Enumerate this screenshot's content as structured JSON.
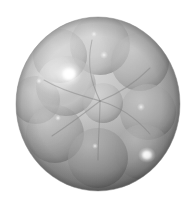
{
  "image": {
    "title": "Translucent sphere cluster render",
    "width": 194,
    "height": 203,
    "background_color": "#ffffff",
    "color_mode": "grayscale",
    "subject": "large translucent outer sphere enclosing a packed cluster of smaller translucent spheres"
  },
  "palette": {
    "background": "#ffffff",
    "outer_sphere_light": "#d8d8d8",
    "outer_sphere_mid": "#b4b4b4",
    "outer_sphere_dark": "#8e8e8e",
    "outer_sphere_rim": "#7b7b7b",
    "inner_sphere_light": "#cfcfcf",
    "inner_sphere_mid": "#a9a9a9",
    "inner_sphere_dark": "#8a8a8a",
    "lobe_edge": "#7f7f7f",
    "specular_white": "#ffffff",
    "shadow_bottom": "#7a7a7a"
  },
  "outer_sphere": {
    "label": "outer-sphere",
    "center_x": 98,
    "center_y": 104,
    "radius_x": 82,
    "radius_y": 87,
    "light_direction": "upper-left",
    "bounds": {
      "left": 16,
      "top": 17,
      "right": 180,
      "bottom": 191
    }
  },
  "inner_spheres": [
    {
      "id": "lobe-top-center",
      "cx": 100,
      "cy": 45,
      "r": 30,
      "shade": "#b9b9b9"
    },
    {
      "id": "lobe-upper-left",
      "cx": 60,
      "cy": 56,
      "r": 27,
      "shade": "#bdbdbd"
    },
    {
      "id": "lobe-upper-right",
      "cx": 140,
      "cy": 62,
      "r": 29,
      "shade": "#ababab"
    },
    {
      "id": "lobe-left-bright",
      "cx": 66,
      "cy": 86,
      "r": 30,
      "shade": "#c8c8c8"
    },
    {
      "id": "lobe-far-left",
      "cx": 36,
      "cy": 100,
      "r": 24,
      "shade": "#b0b0b0"
    },
    {
      "id": "lobe-right-mid",
      "cx": 148,
      "cy": 112,
      "r": 28,
      "shade": "#a4a4a4"
    },
    {
      "id": "lobe-lower-left",
      "cx": 55,
      "cy": 134,
      "r": 29,
      "shade": "#a8a8a8"
    },
    {
      "id": "lobe-bottom-center",
      "cx": 98,
      "cy": 158,
      "r": 30,
      "shade": "#9c9c9c"
    },
    {
      "id": "lobe-lower-right",
      "cx": 143,
      "cy": 152,
      "r": 28,
      "shade": "#a0a0a0"
    },
    {
      "id": "lobe-center-core",
      "cx": 103,
      "cy": 103,
      "r": 20,
      "shade": "#b6b6b6"
    }
  ],
  "convergence_point": {
    "label": "lobe-pinch-point",
    "x": 100,
    "y": 101
  },
  "specular_highlights": [
    {
      "id": "highlight-primary",
      "cx": 69,
      "cy": 74,
      "rx": 13,
      "ry": 12,
      "intensity": 1.0
    },
    {
      "id": "highlight-secondary",
      "cx": 147,
      "cy": 155,
      "rx": 9,
      "ry": 8,
      "intensity": 0.85
    },
    {
      "id": "highlight-top",
      "cx": 104,
      "cy": 55,
      "rx": 4,
      "ry": 4,
      "intensity": 0.45
    },
    {
      "id": "highlight-upper-left",
      "cx": 94,
      "cy": 34,
      "rx": 3,
      "ry": 3,
      "intensity": 0.35
    },
    {
      "id": "highlight-left-small",
      "cx": 39,
      "cy": 81,
      "rx": 3,
      "ry": 3,
      "intensity": 0.4
    },
    {
      "id": "highlight-right",
      "cx": 141,
      "cy": 107,
      "rx": 4,
      "ry": 4,
      "intensity": 0.4
    },
    {
      "id": "highlight-low-left",
      "cx": 58,
      "cy": 118,
      "rx": 3,
      "ry": 3,
      "intensity": 0.35
    },
    {
      "id": "highlight-bottom",
      "cx": 95,
      "cy": 146,
      "rx": 3,
      "ry": 3,
      "intensity": 0.3
    }
  ]
}
